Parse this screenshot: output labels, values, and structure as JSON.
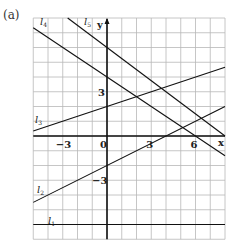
{
  "panel": {
    "label": "(a)"
  },
  "chart_data": {
    "type": "line",
    "title": "",
    "xlabel": "x",
    "ylabel": "y",
    "xlim": [
      -5,
      8
    ],
    "ylim": [
      -7,
      8
    ],
    "grid": true,
    "x_ticks": [
      {
        "value": -3,
        "label": "−3"
      },
      {
        "value": 0,
        "label": "0"
      },
      {
        "value": 3,
        "label": "3"
      },
      {
        "value": 6,
        "label": "6"
      }
    ],
    "y_ticks": [
      {
        "value": 3,
        "label": "3"
      },
      {
        "value": -3,
        "label": "−3"
      }
    ],
    "series": [
      {
        "name": "l1",
        "label": "l",
        "sub": "1",
        "slope": 0,
        "intercept": -6
      },
      {
        "name": "l2",
        "label": "l",
        "sub": "2",
        "slope": 0.5,
        "intercept": -2
      },
      {
        "name": "l3",
        "label": "l",
        "sub": "3",
        "slope": 0.3333,
        "intercept": 2
      },
      {
        "name": "l4",
        "label": "l",
        "sub": "4",
        "slope": -0.6667,
        "intercept": 4
      },
      {
        "name": "l5",
        "label": "l",
        "sub": "5",
        "slope": -0.75,
        "intercept": 6
      }
    ]
  }
}
